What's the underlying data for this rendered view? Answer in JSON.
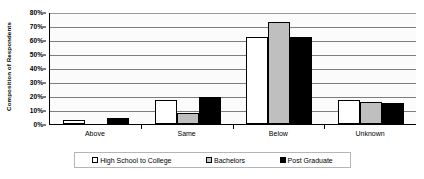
{
  "chart_data": {
    "type": "bar",
    "title": "",
    "subtitle": "",
    "xlabel": "",
    "ylabel": "Composition of Respondents",
    "categories": [
      "Above",
      "Same",
      "Below",
      "Unknown"
    ],
    "series": [
      {
        "name": "High School to College",
        "color": "#ffffff",
        "values": [
          3,
          17,
          62,
          17
        ]
      },
      {
        "name": "Bachelors",
        "color": "#bfbfbf",
        "values": [
          0,
          8,
          73,
          16
        ]
      },
      {
        "name": "Post Graduate",
        "color": "#000000",
        "values": [
          4,
          19,
          62,
          15
        ]
      }
    ],
    "ylim": [
      0,
      80
    ],
    "ytick_labels": [
      "0%",
      "10%",
      "20%",
      "30%",
      "40%",
      "50%",
      "60%",
      "70%",
      "80%"
    ],
    "ytick_values": [
      0,
      10,
      20,
      30,
      40,
      50,
      60,
      70,
      80
    ],
    "grid": true,
    "legend_position": "bottom",
    "value_unit": "%"
  }
}
